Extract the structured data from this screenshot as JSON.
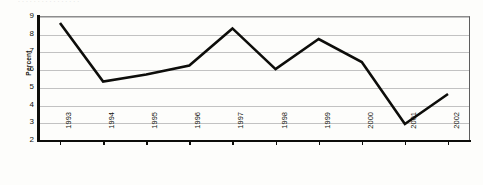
{
  "top_fragment_text": "................",
  "chart_data": {
    "type": "line",
    "title": "",
    "xlabel": "",
    "ylabel": "Percent",
    "categories": [
      "1993",
      "1994",
      "1995",
      "1996",
      "1997",
      "1998",
      "1999",
      "2000",
      "2001",
      "2002"
    ],
    "values": [
      8.6,
      5.3,
      5.7,
      6.2,
      8.3,
      6.0,
      7.7,
      6.4,
      2.9,
      4.6
    ],
    "series": [
      {
        "name": "Percent",
        "values": [
          8.6,
          5.3,
          5.7,
          6.2,
          8.3,
          6.0,
          7.7,
          6.4,
          2.9,
          4.6
        ]
      }
    ],
    "ylim": [
      2,
      9
    ],
    "y_ticks": [
      9,
      8,
      7,
      6,
      5,
      4,
      3,
      2
    ],
    "grid": true,
    "legend": "none",
    "line_color": "#0d0d0a",
    "grid_color": "#c2c2c2",
    "axis_color": "#0d0d0a",
    "background_color": "#fdfdfb"
  }
}
